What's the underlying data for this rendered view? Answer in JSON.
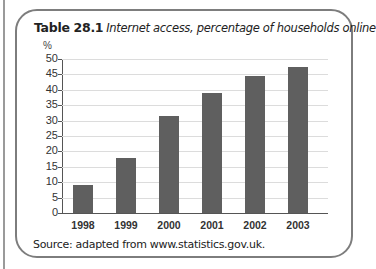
{
  "figure": {
    "title_number": "Table 28.1",
    "title_text": "Internet access, percentage of households online",
    "unit_label": "%",
    "source": "Source: adapted from www.statistics.gov.uk."
  },
  "colors": {
    "bar": "#5f5f5f",
    "frame": "#7d7d7d",
    "gridline": "#dcdcdc"
  },
  "chart_data": {
    "type": "bar",
    "categories": [
      "1998",
      "1999",
      "2000",
      "2001",
      "2002",
      "2003"
    ],
    "values": [
      9,
      18,
      31.5,
      39,
      44.5,
      47.5
    ],
    "xlabel": "",
    "ylabel": "%",
    "ylim": [
      0,
      50
    ],
    "yticks": [
      0,
      5,
      10,
      15,
      20,
      25,
      30,
      35,
      40,
      45,
      50
    ],
    "grid": true,
    "legend": null,
    "source": "Source: adapted from www.statistics.gov.uk."
  }
}
